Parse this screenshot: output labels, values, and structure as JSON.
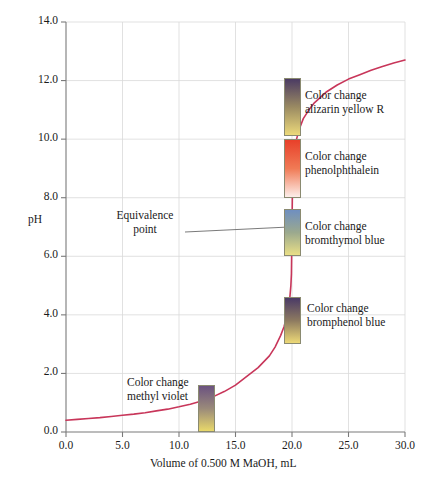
{
  "chart_data": {
    "type": "line",
    "title": "",
    "xlabel": "Volume of 0.500 M MaOH, mL",
    "ylabel": "pH",
    "xlim": [
      0.0,
      30.0
    ],
    "ylim": [
      0.0,
      14.0
    ],
    "grid": true,
    "legend_position": "none",
    "xticks": [
      "0.0",
      "5.0",
      "10.0",
      "15.0",
      "20.0",
      "25.0",
      "30.0"
    ],
    "xtick_values": [
      0,
      5,
      10,
      15,
      20,
      25,
      30
    ],
    "yticks": [
      "0.0",
      "2.0",
      "4.0",
      "6.0",
      "8.0",
      "10.0",
      "12.0",
      "14.0"
    ],
    "ytick_values": [
      0,
      2,
      4,
      6,
      8,
      10,
      12,
      14
    ],
    "series": [
      {
        "name": "Titration curve",
        "color": "#c8365a",
        "x": [
          0.0,
          1.0,
          2.0,
          3.0,
          4.0,
          5.0,
          6.0,
          7.0,
          8.0,
          9.0,
          10.0,
          11.0,
          12.0,
          13.0,
          14.0,
          15.0,
          16.0,
          17.0,
          18.0,
          18.5,
          19.0,
          19.3,
          19.6,
          19.8,
          19.9,
          19.95,
          20.0,
          20.05,
          20.1,
          20.2,
          20.4,
          20.7,
          21.0,
          21.5,
          22.0,
          23.0,
          24.0,
          25.0,
          26.0,
          27.0,
          28.0,
          29.0,
          30.0
        ],
        "y": [
          0.4,
          0.43,
          0.46,
          0.49,
          0.53,
          0.57,
          0.61,
          0.66,
          0.72,
          0.78,
          0.86,
          0.95,
          1.06,
          1.2,
          1.38,
          1.6,
          1.9,
          2.2,
          2.6,
          2.9,
          3.3,
          3.6,
          4.05,
          4.55,
          5.0,
          5.4,
          7.0,
          8.6,
          9.0,
          9.5,
          10.0,
          10.4,
          10.7,
          11.0,
          11.25,
          11.6,
          11.85,
          12.05,
          12.2,
          12.35,
          12.48,
          12.6,
          12.7
        ]
      }
    ],
    "annotations": [
      {
        "name": "equivalence-point",
        "lines": [
          "Equivalence",
          "point"
        ],
        "point_x": 20.0,
        "point_y": 7.0
      }
    ],
    "indicators": [
      {
        "name": "alizarin-yellow-r",
        "label_lines": [
          "Color change",
          "alizarin yellow R"
        ],
        "ph_low": 10.1,
        "ph_high": 12.1,
        "volume": 20.0,
        "color_high": "#4b3b63",
        "color_mid": "#9a8a62",
        "color_low": "#ecd97a"
      },
      {
        "name": "phenolphthalein",
        "label_lines": [
          "Color change",
          "phenolphthalein"
        ],
        "ph_low": 8.0,
        "ph_high": 10.0,
        "volume": 20.0,
        "color_high": "#e8402a",
        "color_mid": "#f07a55",
        "color_low": "#fdeeea"
      },
      {
        "name": "bromthymol-blue",
        "label_lines": [
          "Color change",
          "bromthymol blue"
        ],
        "ph_low": 6.0,
        "ph_high": 7.6,
        "volume": 20.0,
        "color_high": "#6f8fc0",
        "color_mid": "#9ba98e",
        "color_low": "#e9df86"
      },
      {
        "name": "bromphenol-blue",
        "label_lines": [
          "Color change",
          "bromphenol blue"
        ],
        "ph_low": 3.0,
        "ph_high": 4.6,
        "volume": 20.0,
        "color_high": "#4a3a66",
        "color_mid": "#8d7a60",
        "color_low": "#edd977"
      },
      {
        "name": "methyl-violet",
        "label_lines": [
          "Color change",
          "methyl violet"
        ],
        "ph_low": 0.0,
        "ph_high": 1.6,
        "volume": 12.4,
        "color_high": "#6b5280",
        "color_mid": "#9a8a7a",
        "color_low": "#e8d86a"
      }
    ]
  }
}
